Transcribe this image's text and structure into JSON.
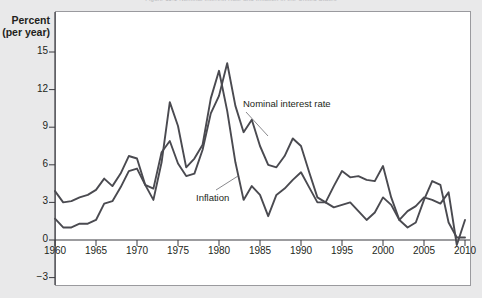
{
  "figure": {
    "caption_top": "Figure 11.1 Nominal Interest Rate and Inflation in the United States",
    "background_color": "#e9e9ea",
    "panel_color": "#ffffff",
    "line_color": "#4a4a50"
  },
  "chart_data": {
    "type": "line",
    "title": "",
    "xlabel": "",
    "ylabel": "Percent (per year)",
    "ylabel_line1": "Percent",
    "ylabel_line2": "(per year)",
    "xlim": [
      1959,
      2010
    ],
    "ylim": [
      -3,
      16
    ],
    "yticks": [
      15,
      12,
      9,
      6,
      3,
      0,
      -3
    ],
    "ytick_labels": [
      "15",
      "12",
      "9",
      "6",
      "3",
      "0",
      "−3"
    ],
    "xticks": [
      1960,
      1965,
      1970,
      1975,
      1980,
      1985,
      1990,
      1995,
      2000,
      2005,
      2010
    ],
    "xtick_labels": [
      "1960",
      "1965",
      "1970",
      "1975",
      "1980",
      "1985",
      "1990",
      "1995",
      "2000",
      "2005",
      "2010"
    ],
    "grid": false,
    "legend_position": "inline-annotations",
    "annotations": [
      {
        "text": "Nominal interest rate",
        "x": 1987.5,
        "y": 10.6
      },
      {
        "text": "Inflation",
        "x": 1977.0,
        "y": 3.3
      }
    ],
    "x": [
      1960,
      1961,
      1962,
      1963,
      1964,
      1965,
      1966,
      1967,
      1968,
      1969,
      1970,
      1971,
      1972,
      1973,
      1974,
      1975,
      1976,
      1977,
      1978,
      1979,
      1980,
      1981,
      1982,
      1983,
      1984,
      1985,
      1986,
      1987,
      1988,
      1989,
      1990,
      1991,
      1992,
      1993,
      1994,
      1995,
      1996,
      1997,
      1998,
      1999,
      2000,
      2001,
      2002,
      2003,
      2004,
      2005,
      2006,
      2007,
      2008,
      2009,
      2010
    ],
    "series": [
      {
        "name": "Nominal interest rate",
        "label": "Nominal interest rate",
        "color": "#4a4a50",
        "values": [
          3.9,
          3.0,
          3.1,
          3.4,
          3.6,
          4.0,
          4.9,
          4.3,
          5.3,
          6.7,
          6.5,
          4.4,
          4.1,
          7.0,
          7.9,
          6.1,
          5.1,
          5.3,
          7.2,
          10.1,
          11.5,
          14.1,
          10.7,
          8.6,
          9.6,
          7.5,
          6.0,
          5.8,
          6.7,
          8.1,
          7.5,
          5.4,
          3.4,
          3.0,
          4.3,
          5.5,
          5.0,
          5.1,
          4.8,
          4.7,
          5.9,
          3.4,
          1.6,
          1.0,
          1.4,
          3.2,
          4.7,
          4.4,
          1.4,
          0.2,
          0.2
        ]
      },
      {
        "name": "Inflation",
        "label": "Inflation",
        "color": "#4a4a50",
        "values": [
          1.7,
          1.0,
          1.0,
          1.3,
          1.3,
          1.6,
          2.9,
          3.1,
          4.2,
          5.5,
          5.7,
          4.4,
          3.2,
          6.2,
          11.0,
          9.1,
          5.8,
          6.5,
          7.6,
          11.3,
          13.5,
          10.3,
          6.2,
          3.2,
          4.3,
          3.6,
          1.9,
          3.6,
          4.1,
          4.8,
          5.4,
          4.2,
          3.0,
          3.0,
          2.6,
          2.8,
          3.0,
          2.3,
          1.6,
          2.2,
          3.4,
          2.8,
          1.6,
          2.3,
          2.7,
          3.4,
          3.2,
          2.9,
          3.8,
          -0.4,
          1.6
        ]
      }
    ]
  }
}
